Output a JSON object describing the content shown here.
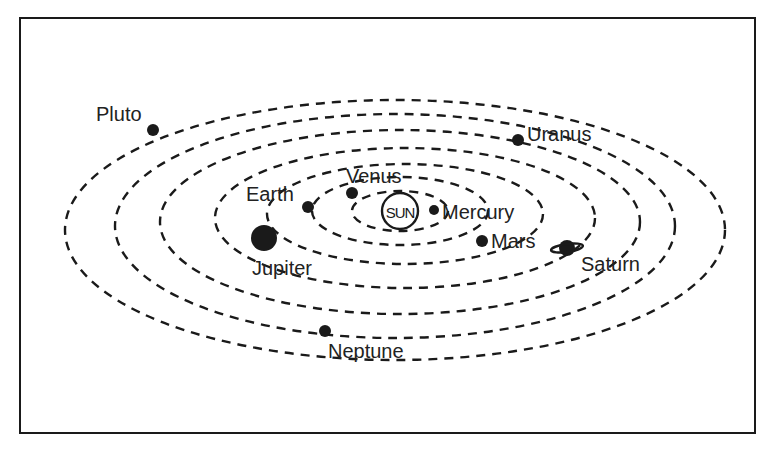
{
  "diagram": {
    "sun_label": "SUN",
    "colors": {
      "ink": "#1a1a1a",
      "text": "#222222",
      "background": "#ffffff"
    },
    "orbits": [
      {
        "name": "orbit-1",
        "cx": 400,
        "cy": 211,
        "rx": 48,
        "ry": 20
      },
      {
        "name": "orbit-2",
        "cx": 400,
        "cy": 211,
        "rx": 88,
        "ry": 34
      },
      {
        "name": "orbit-3",
        "cx": 405,
        "cy": 214,
        "rx": 138,
        "ry": 50
      },
      {
        "name": "orbit-4",
        "cx": 405,
        "cy": 218,
        "rx": 190,
        "ry": 70
      },
      {
        "name": "orbit-5",
        "cx": 400,
        "cy": 222,
        "rx": 240,
        "ry": 92
      },
      {
        "name": "orbit-6",
        "cx": 395,
        "cy": 226,
        "rx": 280,
        "ry": 112
      },
      {
        "name": "orbit-7",
        "cx": 395,
        "cy": 230,
        "rx": 330,
        "ry": 130
      }
    ],
    "bodies": [
      {
        "name": "Pluto",
        "x": 153,
        "y": 130,
        "r": 6
      },
      {
        "name": "Uranus",
        "x": 518,
        "y": 140,
        "r": 6
      },
      {
        "name": "Venus",
        "x": 352,
        "y": 193,
        "r": 6
      },
      {
        "name": "Earth",
        "x": 308,
        "y": 207,
        "r": 6
      },
      {
        "name": "Mercury",
        "x": 434,
        "y": 210,
        "r": 5
      },
      {
        "name": "Mars",
        "x": 482,
        "y": 241,
        "r": 6
      },
      {
        "name": "Jupiter",
        "x": 264,
        "y": 238,
        "r": 13
      },
      {
        "name": "Saturn",
        "x": 567,
        "y": 248,
        "r": 8
      },
      {
        "name": "Neptune",
        "x": 325,
        "y": 331,
        "r": 6
      }
    ],
    "labels": {
      "pluto": {
        "text": "Pluto",
        "x": 96,
        "y": 104
      },
      "uranus": {
        "text": "Uranus",
        "x": 527,
        "y": 124
      },
      "venus": {
        "text": "Venus",
        "x": 346,
        "y": 166
      },
      "earth": {
        "text": "Earth",
        "x": 246,
        "y": 184
      },
      "mercury": {
        "text": "Mercury",
        "x": 442,
        "y": 202
      },
      "mars": {
        "text": "Mars",
        "x": 491,
        "y": 231
      },
      "jupiter": {
        "text": "Jupiter",
        "x": 252,
        "y": 258
      },
      "saturn": {
        "text": "Saturn",
        "x": 581,
        "y": 254
      },
      "neptune": {
        "text": "Neptune",
        "x": 328,
        "y": 341
      }
    }
  }
}
